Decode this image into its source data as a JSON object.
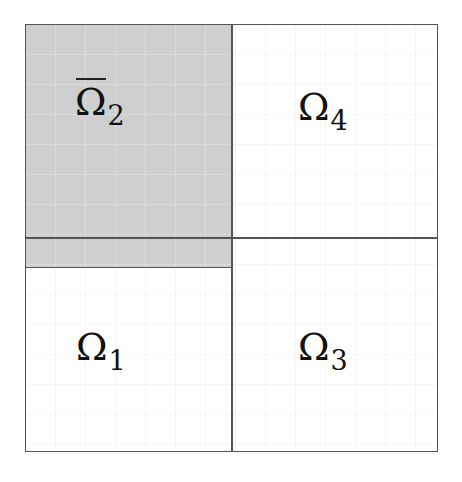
{
  "diagram": {
    "type": "domain-decomposition",
    "regions": [
      {
        "id": "omega2bar",
        "symbol": "Ω",
        "subscript": "2",
        "overline": true,
        "shaded": true,
        "position": "top-left"
      },
      {
        "id": "omega4",
        "symbol": "Ω",
        "subscript": "4",
        "overline": false,
        "shaded": false,
        "position": "top-right"
      },
      {
        "id": "omega1",
        "symbol": "Ω",
        "subscript": "1",
        "overline": false,
        "shaded": false,
        "position": "bottom-left"
      },
      {
        "id": "omega3",
        "symbol": "Ω",
        "subscript": "3",
        "overline": false,
        "shaded": false,
        "position": "bottom-right"
      }
    ],
    "colors": {
      "shade": "#cfcfcf",
      "border": "#555555",
      "background": "#ffffff"
    }
  }
}
